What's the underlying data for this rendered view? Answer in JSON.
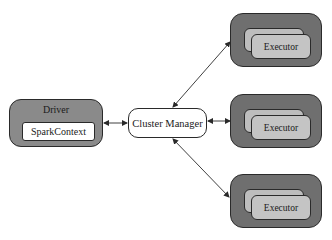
{
  "diagram": {
    "driver": {
      "label": "Driver",
      "inner_label": "SparkContext"
    },
    "cluster_manager": {
      "label": "Cluster Manager"
    },
    "worker_nodes": [
      {
        "label": "Executor"
      },
      {
        "label": "Executor"
      },
      {
        "label": "Executor"
      }
    ],
    "connections": [
      {
        "from": "Driver",
        "to": "Cluster Manager",
        "type": "bidirectional"
      },
      {
        "from": "Cluster Manager",
        "to": "Executor (top)",
        "type": "bidirectional"
      },
      {
        "from": "Cluster Manager",
        "to": "Executor (middle)",
        "type": "bidirectional"
      },
      {
        "from": "Cluster Manager",
        "to": "Executor (bottom)",
        "type": "bidirectional"
      }
    ],
    "colors": {
      "driver_fill": "#8a8a8a",
      "node_fill": "#6f6f6f",
      "executor_fill": "#c4c4c4",
      "stroke": "#2a2a2a"
    }
  }
}
